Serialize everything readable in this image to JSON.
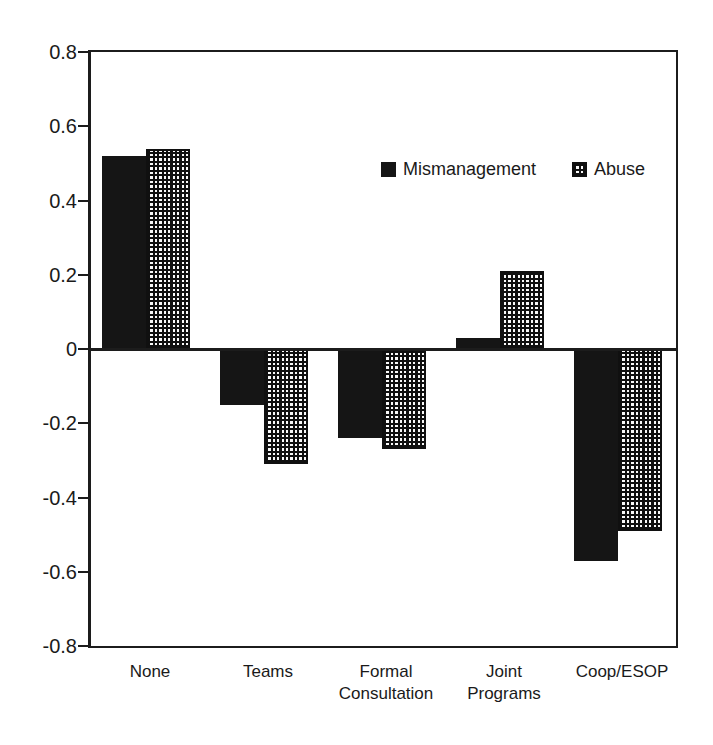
{
  "figure": {
    "title": "",
    "background": "#ffffff"
  },
  "colors": {
    "axis": "#1c1c1c",
    "text": "#1a1a1a",
    "bar_fill": "#151515",
    "background": "#ffffff"
  },
  "chart_data": {
    "type": "bar",
    "title": "",
    "xlabel": "",
    "ylabel": "",
    "categories": [
      "None",
      "Teams",
      "Formal Consultation",
      "Joint Programs",
      "Coop/ESOP"
    ],
    "category_lines": [
      [
        "None"
      ],
      [
        "Teams"
      ],
      [
        "Formal",
        "Consultation"
      ],
      [
        "Joint",
        "Programs"
      ],
      [
        "Coop/ESOP"
      ]
    ],
    "series": [
      {
        "name": "Mismanagement",
        "pattern": "solid",
        "color": "#151515",
        "values": [
          0.52,
          -0.15,
          -0.24,
          0.03,
          -0.57
        ]
      },
      {
        "name": "Abuse",
        "pattern": "crosshatch-grid",
        "color": "#151515",
        "values": [
          0.54,
          -0.31,
          -0.27,
          0.21,
          -0.49
        ]
      }
    ],
    "ylim": [
      -0.8,
      0.8
    ],
    "ytick_step": 0.2,
    "yticks": [
      "0.8",
      "0.6",
      "0.4",
      "0.2",
      "0",
      "-0.2",
      "-0.4",
      "-0.6",
      "-0.8"
    ],
    "grid": false,
    "zero_baseline": true,
    "legend_position": "inside-top"
  }
}
